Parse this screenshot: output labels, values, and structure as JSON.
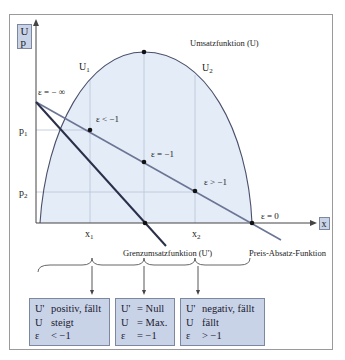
{
  "axis": {
    "y_labels": [
      "U",
      "p"
    ],
    "x_label": "x",
    "ticks_y": {
      "p1": "p",
      "p1_sub": "1",
      "p2": "p",
      "p2_sub": "2"
    },
    "ticks_x": {
      "x1": "x",
      "x1_sub": "1",
      "x2": "x",
      "x2_sub": "2"
    }
  },
  "curve_labels": {
    "revenue": "Umsatzfunktion (U)",
    "u1": "U",
    "u1_sub": "1",
    "u2": "U",
    "u2_sub": "2",
    "marginal": "Grenzumsatzfunktion (U')",
    "demand": "Preis-Absatz-Funktion"
  },
  "elasticity": {
    "minus_inf": "ε = − ∞",
    "lt": "ε < −1",
    "eq": "ε = −1",
    "gt": "ε > −1",
    "zero": "ε = 0"
  },
  "boxes": [
    {
      "rows": [
        [
          "U'",
          "positiv, fällt"
        ],
        [
          "U",
          "steigt"
        ],
        [
          "ε",
          "< −1"
        ]
      ]
    },
    {
      "rows": [
        [
          "U'",
          "= Null"
        ],
        [
          "U",
          "= Max."
        ],
        [
          "ε",
          "= −1"
        ]
      ]
    },
    {
      "rows": [
        [
          "U'",
          "negativ, fällt"
        ],
        [
          "U",
          "fällt"
        ],
        [
          "ε",
          "> −1"
        ]
      ]
    }
  ],
  "colors": {
    "fill": "#e3ecf7",
    "demand_line": "#6b7594",
    "marginal_line": "#2a2f4a",
    "box_fill": "#c9d3e8",
    "frame": "#9a9a9a"
  }
}
